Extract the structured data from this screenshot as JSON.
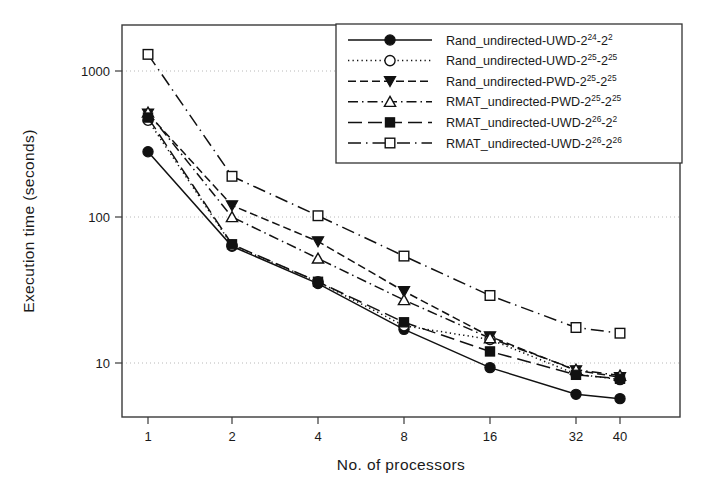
{
  "chart_data": {
    "type": "line",
    "title": "",
    "xlabel": "No. of processors",
    "ylabel": "Execution time (seconds)",
    "xscale": "log2",
    "yscale": "log10",
    "x": [
      1,
      2,
      4,
      8,
      16,
      32,
      40
    ],
    "xtick_labels": [
      "1",
      "2",
      "4",
      "8",
      "16",
      "32",
      "40"
    ],
    "ytick_labels": [
      "10",
      "100",
      "1000"
    ],
    "yticks": [
      10,
      100,
      1000
    ],
    "ylim": [
      4.5,
      2000
    ],
    "grid": "horizontal-dotted",
    "legend_position": "top-right-inside",
    "series": [
      {
        "name": "Rand_undirected-UWD-2^24-2^2",
        "label_main": "Rand_undirected-UWD-2",
        "sup1": "24",
        "mid": "-2",
        "sup2": "2",
        "linestyle": "solid",
        "marker": "filled-circle",
        "values": [
          280,
          63,
          35,
          17,
          9.3,
          6.1,
          5.7
        ]
      },
      {
        "name": "Rand_undirected-UWD-2^25-2^25",
        "label_main": "Rand_undirected-UWD-2",
        "sup1": "25",
        "mid": "-2",
        "sup2": "25",
        "linestyle": "dotted",
        "marker": "open-circle",
        "values": [
          460,
          64,
          36,
          18,
          14.5,
          8.4,
          7.7
        ]
      },
      {
        "name": "Rand_undirected-PWD-2^25-2^25",
        "label_main": "Rand_undirected-PWD-2",
        "sup1": "25",
        "mid": "-2",
        "sup2": "25",
        "linestyle": "dashed",
        "marker": "filled-triangle-down",
        "values": [
          510,
          120,
          68,
          31,
          15.2,
          8.9,
          8.0
        ]
      },
      {
        "name": "RMAT_undirected-PWD-2^25-2^25",
        "label_main": "RMAT_undirected-PWD-2",
        "sup1": "25",
        "mid": "-2",
        "sup2": "25",
        "linestyle": "dashdot",
        "marker": "open-triangle-up",
        "values": [
          520,
          100,
          52,
          27,
          14.8,
          9.0,
          8.2
        ]
      },
      {
        "name": "RMAT_undirected-UWD-2^26-2^2",
        "label_main": "RMAT_undirected-UWD-2",
        "sup1": "26",
        "mid": "-2",
        "sup2": "2",
        "linestyle": "longdash",
        "marker": "filled-square",
        "values": [
          480,
          65,
          36,
          19,
          12.0,
          8.3,
          7.8
        ]
      },
      {
        "name": "RMAT_undirected-UWD-2^26-2^26",
        "label_main": "RMAT_undirected-UWD-2",
        "sup1": "26",
        "mid": "-2",
        "sup2": "26",
        "linestyle": "dashdotlong",
        "marker": "open-square",
        "values": [
          1300,
          190,
          102,
          54,
          29,
          17.5,
          16.0
        ]
      }
    ]
  },
  "colors": {
    "foreground": "#111111",
    "frame": "#3a3a3a",
    "grid": "#b8b8b8",
    "background": "#ffffff"
  }
}
